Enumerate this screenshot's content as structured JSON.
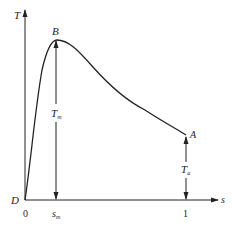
{
  "diagram": {
    "type": "torque-slip curve",
    "axes": {
      "y_label": "T",
      "x_label": "s",
      "origin_point": "D",
      "origin_tick": "0",
      "x_ticks": [
        {
          "label_main": "s",
          "label_sub": "m"
        },
        {
          "label_main": "1",
          "label_sub": ""
        }
      ]
    },
    "points": {
      "peak": {
        "label": "B"
      },
      "start": {
        "label": "A"
      },
      "origin": {
        "label": "D"
      }
    },
    "dimensions": {
      "max_torque": {
        "main": "T",
        "sub": "m"
      },
      "start_torque": {
        "main": "T",
        "sub": "a"
      }
    },
    "colors": {
      "line": "#222222",
      "background": "#ffffff"
    }
  }
}
